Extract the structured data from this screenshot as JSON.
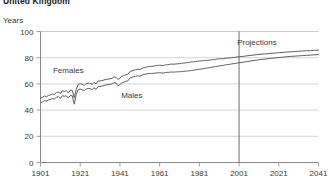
{
  "chart_data": {
    "type": "line",
    "title": "United Kingdom",
    "ylabel": "Years",
    "xlabel": "",
    "ylim": [
      0,
      100
    ],
    "xlim": [
      1901,
      2041
    ],
    "grid": true,
    "legend_position": "inline-annotations",
    "y_ticks": [
      "0",
      "20",
      "40",
      "60",
      "80",
      "100"
    ],
    "y_tick_values": [
      0,
      20,
      40,
      60,
      80,
      100
    ],
    "x_ticks": [
      "1901",
      "1921",
      "1941",
      "1961",
      "1981",
      "2001",
      "2021",
      "2041"
    ],
    "x_tick_values": [
      1901,
      1921,
      1941,
      1961,
      1981,
      2001,
      2021,
      2041
    ],
    "annotations": [
      {
        "text": "Females",
        "x": 1915,
        "y": 68
      },
      {
        "text": "Males",
        "x": 1947,
        "y": 49
      },
      {
        "text": "Projections",
        "x": 2010,
        "y": 90
      }
    ],
    "projection_divider": {
      "x": 2001,
      "label": "Projections"
    },
    "series": [
      {
        "name": "Females",
        "x": [
          1901,
          1902,
          1903,
          1904,
          1905,
          1906,
          1907,
          1908,
          1909,
          1910,
          1911,
          1912,
          1913,
          1914,
          1915,
          1916,
          1917,
          1918,
          1919,
          1920,
          1921,
          1922,
          1923,
          1924,
          1925,
          1926,
          1927,
          1928,
          1929,
          1930,
          1931,
          1932,
          1933,
          1934,
          1935,
          1936,
          1937,
          1938,
          1939,
          1940,
          1941,
          1942,
          1943,
          1944,
          1945,
          1946,
          1947,
          1948,
          1949,
          1950,
          1951,
          1952,
          1953,
          1954,
          1955,
          1956,
          1957,
          1958,
          1959,
          1960,
          1961,
          1962,
          1963,
          1964,
          1965,
          1966,
          1967,
          1968,
          1969,
          1970,
          1971,
          1972,
          1973,
          1974,
          1975,
          1976,
          1977,
          1978,
          1979,
          1980,
          1981,
          1982,
          1983,
          1984,
          1985,
          1986,
          1987,
          1988,
          1989,
          1990,
          1991,
          1992,
          1993,
          1994,
          1995,
          1996,
          1997,
          1998,
          1999,
          2000,
          2001,
          2003,
          2005,
          2007,
          2009,
          2011,
          2013,
          2015,
          2017,
          2019,
          2021,
          2023,
          2025,
          2027,
          2029,
          2031,
          2033,
          2035,
          2037,
          2039,
          2041
        ],
        "y": [
          49.0,
          49.8,
          50.8,
          50.2,
          51.2,
          51.6,
          52.3,
          52.0,
          53.4,
          53.8,
          52.6,
          54.8,
          54.3,
          54.7,
          53.2,
          55.2,
          55.0,
          49.5,
          56.0,
          59.6,
          60.2,
          59.6,
          58.8,
          60.3,
          60.6,
          60.5,
          59.6,
          61.1,
          60.0,
          62.2,
          62.3,
          62.5,
          63.0,
          63.4,
          63.6,
          64.0,
          64.2,
          65.4,
          65.0,
          63.4,
          64.5,
          65.8,
          66.4,
          67.0,
          67.3,
          69.3,
          69.9,
          70.5,
          70.8,
          71.2,
          70.9,
          71.8,
          72.2,
          72.7,
          73.1,
          73.2,
          73.4,
          73.6,
          73.9,
          74.2,
          74.2,
          74.1,
          74.0,
          74.6,
          74.7,
          74.9,
          75.2,
          75.0,
          75.2,
          75.3,
          75.5,
          75.7,
          75.9,
          76.0,
          76.3,
          76.4,
          76.8,
          76.8,
          77.0,
          77.2,
          77.5,
          77.6,
          77.7,
          78.0,
          77.9,
          78.1,
          78.4,
          78.5,
          78.6,
          79.0,
          79.1,
          79.3,
          79.2,
          79.6,
          79.7,
          79.8,
          80.0,
          80.2,
          80.3,
          80.6,
          80.7,
          81.0,
          81.4,
          81.8,
          82.2,
          82.5,
          82.8,
          83.0,
          83.3,
          83.5,
          83.8,
          84.0,
          84.3,
          84.5,
          84.7,
          84.9,
          85.1,
          85.3,
          85.4,
          85.6,
          85.8
        ]
      },
      {
        "name": "Males",
        "x": [
          1901,
          1902,
          1903,
          1904,
          1905,
          1906,
          1907,
          1908,
          1909,
          1910,
          1911,
          1912,
          1913,
          1914,
          1915,
          1916,
          1917,
          1918,
          1919,
          1920,
          1921,
          1922,
          1923,
          1924,
          1925,
          1926,
          1927,
          1928,
          1929,
          1930,
          1931,
          1932,
          1933,
          1934,
          1935,
          1936,
          1937,
          1938,
          1939,
          1940,
          1941,
          1942,
          1943,
          1944,
          1945,
          1946,
          1947,
          1948,
          1949,
          1950,
          1951,
          1952,
          1953,
          1954,
          1955,
          1956,
          1957,
          1958,
          1959,
          1960,
          1961,
          1962,
          1963,
          1964,
          1965,
          1966,
          1967,
          1968,
          1969,
          1970,
          1971,
          1972,
          1973,
          1974,
          1975,
          1976,
          1977,
          1978,
          1979,
          1980,
          1981,
          1982,
          1983,
          1984,
          1985,
          1986,
          1987,
          1988,
          1989,
          1990,
          1991,
          1992,
          1993,
          1994,
          1995,
          1996,
          1997,
          1998,
          1999,
          2000,
          2001,
          2003,
          2005,
          2007,
          2009,
          2011,
          2013,
          2015,
          2017,
          2019,
          2021,
          2023,
          2025,
          2027,
          2029,
          2031,
          2033,
          2035,
          2037,
          2039,
          2041
        ],
        "y": [
          45.5,
          46.3,
          47.3,
          46.8,
          47.8,
          48.1,
          48.8,
          48.4,
          49.8,
          50.2,
          48.9,
          51.0,
          50.6,
          50.9,
          49.3,
          51.2,
          51.0,
          44.5,
          52.0,
          55.6,
          56.1,
          55.6,
          54.9,
          56.2,
          56.5,
          56.4,
          55.6,
          57.0,
          55.9,
          58.0,
          58.1,
          58.3,
          58.8,
          59.2,
          59.4,
          59.8,
          59.9,
          61.0,
          60.6,
          58.6,
          59.5,
          60.8,
          61.4,
          62.0,
          62.3,
          64.4,
          65.0,
          65.6,
          65.9,
          66.2,
          65.9,
          66.7,
          67.1,
          67.5,
          67.8,
          67.9,
          68.0,
          68.1,
          68.3,
          68.5,
          68.5,
          68.4,
          68.3,
          68.7,
          68.8,
          68.9,
          69.1,
          69.0,
          69.1,
          69.2,
          69.3,
          69.4,
          69.6,
          69.7,
          69.9,
          70.0,
          70.3,
          70.4,
          70.6,
          70.9,
          71.2,
          71.4,
          71.6,
          72.0,
          72.1,
          72.4,
          72.7,
          72.9,
          73.1,
          73.5,
          73.7,
          74.0,
          74.1,
          74.5,
          74.7,
          74.9,
          75.2,
          75.4,
          75.6,
          75.9,
          76.1,
          76.5,
          77.0,
          77.5,
          78.0,
          78.4,
          78.8,
          79.1,
          79.5,
          79.8,
          80.1,
          80.4,
          80.7,
          81.0,
          81.2,
          81.4,
          81.6,
          81.8,
          82.0,
          82.2,
          82.4
        ]
      }
    ]
  }
}
